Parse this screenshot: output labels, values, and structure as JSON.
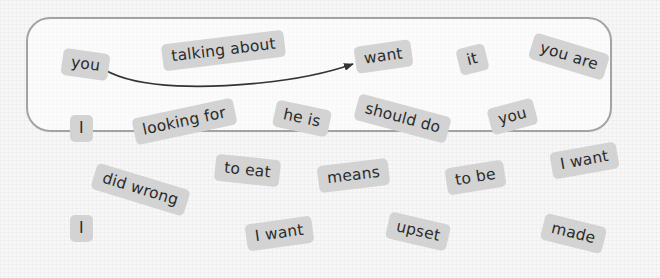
{
  "tiles": [
    {
      "text": "you",
      "x": 62,
      "y": 51,
      "rot": 8
    },
    {
      "text": "talking about",
      "x": 162,
      "y": 37,
      "rot": -7
    },
    {
      "text": "want",
      "x": 355,
      "y": 43,
      "rot": -8
    },
    {
      "text": "it",
      "x": 458,
      "y": 46,
      "rot": -14
    },
    {
      "text": "you are",
      "x": 530,
      "y": 43,
      "rot": 17
    },
    {
      "text": "I",
      "x": 70,
      "y": 115,
      "rot": 0
    },
    {
      "text": "looking for",
      "x": 133,
      "y": 108,
      "rot": -12
    },
    {
      "text": "he is",
      "x": 274,
      "y": 105,
      "rot": 12
    },
    {
      "text": "should do",
      "x": 355,
      "y": 105,
      "rot": 15
    },
    {
      "text": "you",
      "x": 489,
      "y": 103,
      "rot": -15
    },
    {
      "text": "did wrong",
      "x": 92,
      "y": 176,
      "rot": 17
    },
    {
      "text": "to eat",
      "x": 215,
      "y": 157,
      "rot": 6
    },
    {
      "text": "means",
      "x": 318,
      "y": 162,
      "rot": -7
    },
    {
      "text": "to be",
      "x": 446,
      "y": 164,
      "rot": -9
    },
    {
      "text": "I want",
      "x": 551,
      "y": 147,
      "rot": -10
    },
    {
      "text": "I",
      "x": 70,
      "y": 215,
      "rot": 0
    },
    {
      "text": "I want",
      "x": 246,
      "y": 220,
      "rot": -8
    },
    {
      "text": "upset",
      "x": 387,
      "y": 218,
      "rot": 13
    },
    {
      "text": "made",
      "x": 542,
      "y": 220,
      "rot": 14
    }
  ],
  "arrow": {
    "from": "you",
    "to": "want"
  },
  "colors": {
    "tile_bg": "#d3d3d3",
    "text": "#2b2b2b",
    "border": "#a3a3a3",
    "arrow": "#333333"
  }
}
